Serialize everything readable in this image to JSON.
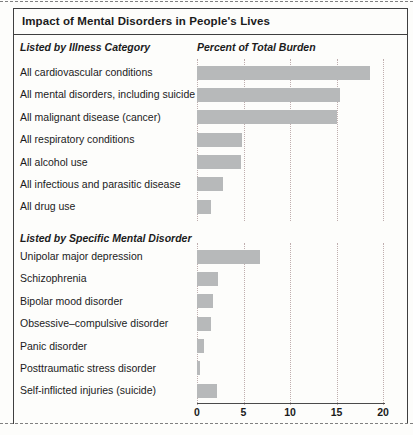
{
  "figure": {
    "title": "Impact of Mental Disorders in People's Lives"
  },
  "chart_data": {
    "type": "bar",
    "orientation": "horizontal",
    "title": "Impact of Mental Disorders in People's Lives",
    "value_axis_label": "Percent of Total Burden",
    "xlim": [
      0,
      20
    ],
    "ticks": [
      0,
      5,
      10,
      15,
      20
    ],
    "grid": "dotted-vertical",
    "sections": [
      {
        "heading": "Listed by Illness Category",
        "categories": [
          "All cardiovascular conditions",
          "All mental disorders, including suicide",
          "All malignant disease (cancer)",
          "All respiratory conditions",
          "All alcohol use",
          "All infectious and parasitic disease",
          "All drug use"
        ],
        "values": [
          18.6,
          15.4,
          15.0,
          4.8,
          4.7,
          2.8,
          1.5
        ]
      },
      {
        "heading": "Listed by Specific Mental Disorder",
        "categories": [
          "Unipolar major depression",
          "Schizophrenia",
          "Bipolar mood disorder",
          "Obsessive–compulsive disorder",
          "Panic disorder",
          "Posttraumatic stress disorder",
          "Self-inflicted injuries (suicide)"
        ],
        "values": [
          6.8,
          2.3,
          1.7,
          1.5,
          0.7,
          0.3,
          2.2
        ]
      }
    ]
  },
  "colors": {
    "bar": "#b7b9ba",
    "border": "#3f3f3f",
    "gridline": "#bfaeae",
    "text": "#1b1b1b"
  }
}
